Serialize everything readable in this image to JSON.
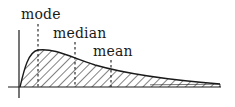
{
  "diagram": {
    "title": "",
    "type": "right-skewed distribution",
    "colors": {
      "stroke": "#1a1a1a",
      "background": "#ffffff",
      "hatch": "#1a1a1a"
    },
    "labels": {
      "mode": "mode",
      "median": "median",
      "mean": "mean"
    },
    "markers": [
      {
        "name": "mode",
        "x": 38,
        "y_top": 24,
        "y_bottom": 87
      },
      {
        "name": "median",
        "x": 75,
        "y_top": 42,
        "y_bottom": 87
      },
      {
        "name": "mean",
        "x": 111,
        "y_top": 60,
        "y_bottom": 87
      }
    ],
    "fill": "diagonal hatching"
  }
}
